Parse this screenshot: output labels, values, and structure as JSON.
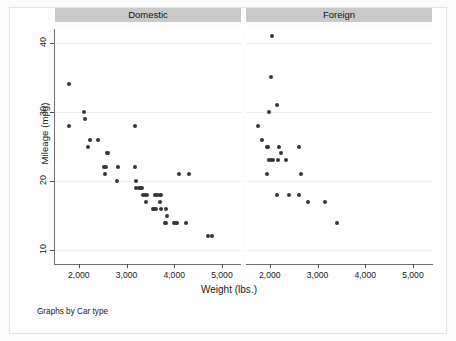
{
  "footer": {
    "note": "Graphs by Car type"
  },
  "chart_data": {
    "type": "scatter",
    "title": "",
    "subtitle": "",
    "xlabel": "Weight (lbs.)",
    "ylabel": "Mileage (mpg)",
    "xlim": [
      1500,
      5400
    ],
    "ylim": [
      8,
      42
    ],
    "xticks": [
      2000,
      3000,
      4000,
      5000
    ],
    "xticklabels": [
      "2,000",
      "3,000",
      "4,000",
      "5,000"
    ],
    "yticks": [
      10,
      20,
      30,
      40
    ],
    "yticklabels": [
      "10",
      "20",
      "30",
      "40"
    ],
    "grid": true,
    "grid_axis": "y",
    "legend": "none",
    "facet_by": "Car type",
    "annotation": "Graphs by Car type",
    "marker_color": "#373737",
    "header_color": "#c9c9c9",
    "panels": [
      {
        "label": "Domestic",
        "points": [
          [
            1800,
            34
          ],
          [
            1800,
            28
          ],
          [
            2100,
            30
          ],
          [
            2130,
            29
          ],
          [
            2230,
            26
          ],
          [
            2200,
            25
          ],
          [
            2400,
            26
          ],
          [
            2580,
            24
          ],
          [
            2600,
            24
          ],
          [
            2520,
            22
          ],
          [
            2560,
            22
          ],
          [
            2540,
            21
          ],
          [
            2830,
            22
          ],
          [
            2800,
            20
          ],
          [
            3180,
            28
          ],
          [
            3170,
            22
          ],
          [
            3200,
            20
          ],
          [
            3200,
            19
          ],
          [
            3250,
            19
          ],
          [
            3280,
            19
          ],
          [
            3300,
            19
          ],
          [
            3330,
            19
          ],
          [
            3350,
            18
          ],
          [
            3380,
            18
          ],
          [
            3420,
            18
          ],
          [
            3400,
            17
          ],
          [
            3600,
            18
          ],
          [
            3630,
            18
          ],
          [
            3700,
            18
          ],
          [
            3730,
            18
          ],
          [
            3550,
            16
          ],
          [
            3580,
            16
          ],
          [
            3620,
            16
          ],
          [
            3700,
            17
          ],
          [
            3720,
            16
          ],
          [
            3830,
            16
          ],
          [
            3850,
            15
          ],
          [
            3800,
            14
          ],
          [
            3830,
            14
          ],
          [
            4000,
            14
          ],
          [
            4030,
            14
          ],
          [
            4060,
            14
          ],
          [
            4100,
            21
          ],
          [
            4300,
            21
          ],
          [
            4250,
            14
          ],
          [
            4700,
            12
          ],
          [
            4800,
            12
          ]
        ]
      },
      {
        "label": "Foreign",
        "points": [
          [
            2050,
            41
          ],
          [
            2020,
            35
          ],
          [
            2150,
            31
          ],
          [
            1990,
            30
          ],
          [
            1760,
            28
          ],
          [
            1830,
            26
          ],
          [
            1930,
            25
          ],
          [
            1960,
            25
          ],
          [
            2200,
            25
          ],
          [
            2620,
            25
          ],
          [
            2240,
            24
          ],
          [
            1990,
            23
          ],
          [
            2030,
            23
          ],
          [
            2060,
            23
          ],
          [
            2160,
            23
          ],
          [
            2330,
            23
          ],
          [
            1930,
            21
          ],
          [
            2650,
            21
          ],
          [
            2150,
            18
          ],
          [
            2400,
            18
          ],
          [
            2600,
            18
          ],
          [
            2800,
            17
          ],
          [
            3150,
            17
          ],
          [
            3400,
            14
          ]
        ]
      }
    ]
  }
}
